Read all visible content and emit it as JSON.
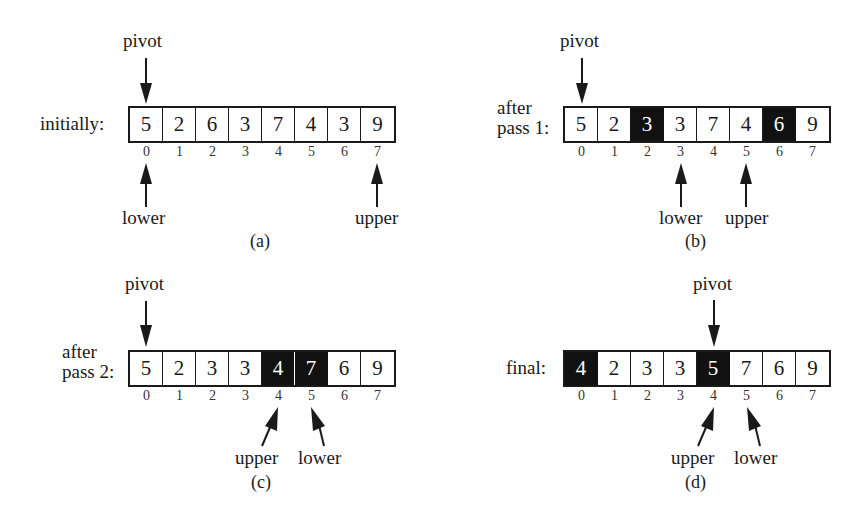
{
  "figure": {
    "panels": [
      {
        "id": "a",
        "caption": "(a)",
        "row_label": [
          "initially:"
        ],
        "values": [
          "5",
          "2",
          "6",
          "3",
          "7",
          "4",
          "3",
          "9"
        ],
        "indices": [
          "0",
          "1",
          "2",
          "3",
          "4",
          "5",
          "6",
          "7"
        ],
        "highlighted": [],
        "pointers": {
          "pivot": 0,
          "lower": 0,
          "upper": 7
        },
        "labels": {
          "pivot": "pivot",
          "lower": "lower",
          "upper": "upper"
        }
      },
      {
        "id": "b",
        "caption": "(b)",
        "row_label": [
          "after",
          "pass 1:"
        ],
        "values": [
          "5",
          "2",
          "3",
          "3",
          "7",
          "4",
          "6",
          "9"
        ],
        "indices": [
          "0",
          "1",
          "2",
          "3",
          "4",
          "5",
          "6",
          "7"
        ],
        "highlighted": [
          2,
          6
        ],
        "pointers": {
          "pivot": 0,
          "lower": 3,
          "upper": 5
        },
        "labels": {
          "pivot": "pivot",
          "lower": "lower",
          "upper": "upper"
        }
      },
      {
        "id": "c",
        "caption": "(c)",
        "row_label": [
          "after",
          "pass 2:"
        ],
        "values": [
          "5",
          "2",
          "3",
          "3",
          "4",
          "7",
          "6",
          "9"
        ],
        "indices": [
          "0",
          "1",
          "2",
          "3",
          "4",
          "5",
          "6",
          "7"
        ],
        "highlighted": [
          4,
          5
        ],
        "pointers": {
          "pivot": 0,
          "upper": 4,
          "lower": 5
        },
        "labels": {
          "pivot": "pivot",
          "lower": "lower",
          "upper": "upper"
        }
      },
      {
        "id": "d",
        "caption": "(d)",
        "row_label": [
          "final:"
        ],
        "values": [
          "4",
          "2",
          "3",
          "3",
          "5",
          "7",
          "6",
          "9"
        ],
        "indices": [
          "0",
          "1",
          "2",
          "3",
          "4",
          "5",
          "6",
          "7"
        ],
        "highlighted": [
          0,
          4
        ],
        "pointers": {
          "pivot": 4,
          "upper": 4,
          "lower": 5
        },
        "labels": {
          "pivot": "pivot",
          "lower": "lower",
          "upper": "upper"
        }
      }
    ],
    "colors": {
      "ink": "#1a1a1a",
      "highlight_fill": "#111111",
      "highlight_text": "#ffffff",
      "background": "#ffffff"
    }
  }
}
